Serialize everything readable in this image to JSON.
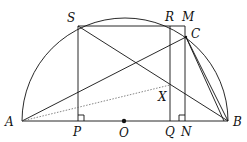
{
  "diagram": {
    "type": "geometry",
    "labels": {
      "A": "A",
      "B": "B",
      "O": "O",
      "S": "S",
      "R": "R",
      "M": "M",
      "C": "C",
      "X": "X",
      "P": "P",
      "Q": "Q",
      "N": "N"
    },
    "points": {
      "A": [
        22,
        121
      ],
      "B": [
        228,
        121
      ],
      "O": [
        124,
        121
      ],
      "S": [
        78,
        26
      ],
      "R": [
        170,
        26
      ],
      "M": [
        185,
        26
      ],
      "C": [
        186,
        37
      ],
      "X": [
        170,
        85
      ],
      "P": [
        78,
        121
      ],
      "Q": [
        170,
        121
      ],
      "N": [
        185,
        121
      ]
    },
    "colors": {
      "stroke": "#111111",
      "background": "#ffffff"
    }
  }
}
